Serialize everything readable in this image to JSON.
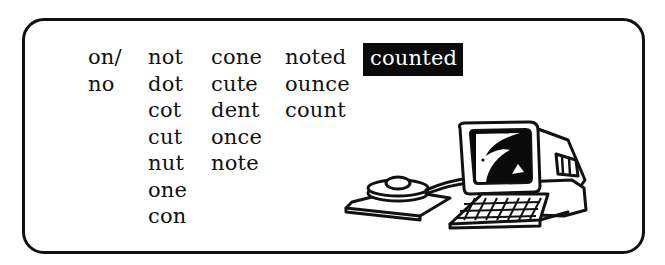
{
  "panel": {
    "columns": [
      {
        "words": [
          "on/",
          "no"
        ]
      },
      {
        "words": [
          "not",
          "dot",
          "cot",
          "cut",
          "nut",
          "one",
          "con"
        ]
      },
      {
        "words": [
          "cone",
          "cute",
          "dent",
          "once",
          "note"
        ]
      },
      {
        "words": [
          "noted",
          "ounce",
          "count"
        ]
      },
      {
        "words": [
          "counted"
        ],
        "highlighted": "counted"
      }
    ]
  },
  "illustration": {
    "icon": "computer-with-mouse-icon",
    "colors": {
      "line": "#111111",
      "fill": "#ffffff"
    }
  },
  "colors": {
    "border": "#111111",
    "text": "#111111",
    "highlight_bg": "#0a0a0a",
    "highlight_text": "#ffffff"
  }
}
